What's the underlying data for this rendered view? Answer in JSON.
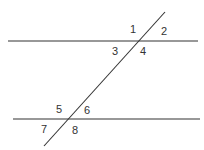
{
  "diagram": {
    "type": "parallel-lines-cut-by-transversal",
    "colors": {
      "line": "#333333",
      "background": "#ffffff"
    },
    "lines": [
      {
        "name": "upper-parallel-line",
        "x1": 8,
        "y1": 41,
        "x2": 198,
        "y2": 41
      },
      {
        "name": "lower-parallel-line",
        "x1": 13,
        "y1": 119,
        "x2": 200,
        "y2": 119
      },
      {
        "name": "transversal-line",
        "x1": 165,
        "y1": 12,
        "x2": 44,
        "y2": 146
      }
    ],
    "angle_labels": [
      {
        "text": "1",
        "x": 130,
        "y": 33
      },
      {
        "text": "2",
        "x": 161,
        "y": 35
      },
      {
        "text": "3",
        "x": 112,
        "y": 55
      },
      {
        "text": "4",
        "x": 140,
        "y": 55
      },
      {
        "text": "5",
        "x": 56,
        "y": 113
      },
      {
        "text": "6",
        "x": 84,
        "y": 114
      },
      {
        "text": "7",
        "x": 41,
        "y": 133
      },
      {
        "text": "8",
        "x": 72,
        "y": 134
      }
    ]
  }
}
